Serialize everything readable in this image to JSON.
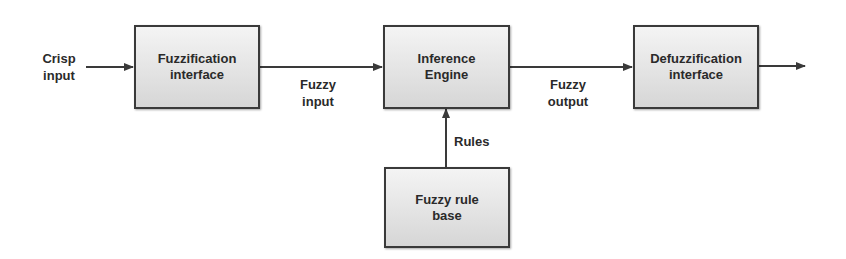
{
  "diagram": {
    "nodes": [
      {
        "id": "fuzzification",
        "line1": "Fuzzification",
        "line2": "interface"
      },
      {
        "id": "inference",
        "line1": "Inference",
        "line2": "Engine"
      },
      {
        "id": "defuzzification",
        "line1": "Defuzzification",
        "line2": "interface"
      },
      {
        "id": "rulebase",
        "line1": "Fuzzy rule",
        "line2": "base"
      }
    ],
    "edges": [
      {
        "from": "input",
        "to": "fuzzification",
        "label_line1": "Crisp",
        "label_line2": "input"
      },
      {
        "from": "fuzzification",
        "to": "inference",
        "label_line1": "Fuzzy",
        "label_line2": "input"
      },
      {
        "from": "inference",
        "to": "defuzzification",
        "label_line1": "Fuzzy",
        "label_line2": "output"
      },
      {
        "from": "rulebase",
        "to": "inference",
        "label": "Rules"
      },
      {
        "from": "defuzzification",
        "to": "output",
        "label": ""
      }
    ],
    "colors": {
      "stroke": "#3a3a3a",
      "box_fill_top": "#f4f4f4",
      "box_fill_bottom": "#d6d6d6",
      "text": "#2a2a2a"
    }
  }
}
